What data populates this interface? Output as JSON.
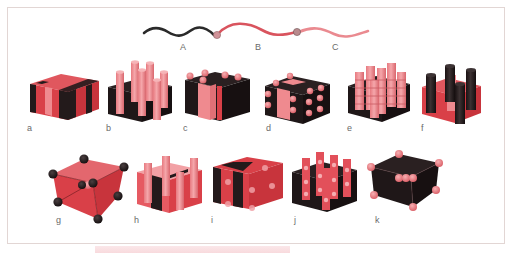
{
  "figure": {
    "polymer_chain": {
      "blocks": [
        {
          "label": "A",
          "color": "#2a2a2a"
        },
        {
          "label": "B",
          "color": "#d9545e"
        },
        {
          "label": "C",
          "color": "#ea8a90"
        }
      ],
      "junction_color": "#c98a8e"
    },
    "colors": {
      "dark": "#231a1b",
      "red": "#d94048",
      "pink": "#ef8a8f",
      "frame_border": "#e2d6d4"
    },
    "panels": [
      {
        "label": "a",
        "description": "alternating lamellae"
      },
      {
        "label": "b",
        "description": "cylinders in matrix"
      },
      {
        "label": "c",
        "description": "cylinders at lamellar interfaces"
      },
      {
        "label": "d",
        "description": "spheres at lamellar interfaces"
      },
      {
        "label": "e",
        "description": "stacked spheres/disks on cylinders"
      },
      {
        "label": "f",
        "description": "core-shell cylinders"
      },
      {
        "label": "g",
        "description": "body-centered spheres"
      },
      {
        "label": "h",
        "description": "lamellae with cylinders"
      },
      {
        "label": "i",
        "description": "lamellae with embedded spheres"
      },
      {
        "label": "j",
        "description": "cylinders with spheres"
      },
      {
        "label": "k",
        "description": "spheres in dark matrix"
      }
    ]
  }
}
